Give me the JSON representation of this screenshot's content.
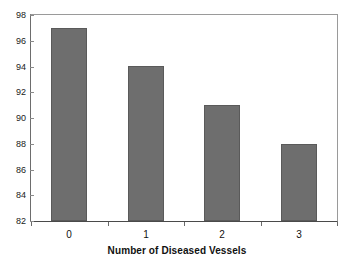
{
  "chart_data": {
    "type": "bar",
    "title": "",
    "subtitle": "",
    "categories": [
      "0",
      "1",
      "2",
      "3"
    ],
    "values": [
      97,
      94,
      91,
      88
    ],
    "series": [
      {
        "name": "Percent",
        "values": [
          97,
          94,
          91,
          88
        ]
      }
    ],
    "xlabel": "Number of Diseased Vessels",
    "ylabel": "",
    "ylim": [
      82,
      98
    ],
    "y_ticks": [
      82,
      84,
      86,
      88,
      90,
      92,
      94,
      96,
      98
    ],
    "y_tick_labels": [
      "82",
      "84",
      "86",
      "88",
      "90",
      "92",
      "94",
      "96",
      "98"
    ],
    "x_tick_labels": [
      "0",
      "1",
      "2",
      "3"
    ],
    "grid": false,
    "legend": false,
    "legend_position": "none",
    "annotations": [],
    "colors": {
      "bar_fill": "#6e6e6e",
      "bar_edge": "#5a5a5a",
      "plot_background": "#ffffff",
      "frame": "#9a9a9a",
      "axis": "#4a4a4a",
      "text": "#111111"
    }
  }
}
